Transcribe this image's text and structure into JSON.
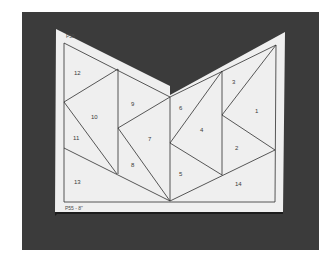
{
  "photo": {
    "subject": "paper piecing quilt pattern on dark background",
    "background_color": "#3b3b3b",
    "paper_color": "#efefef",
    "line_color": "#2e2e2e"
  },
  "pattern": {
    "top_label": "P55",
    "bottom_label": "P55 - 8\"",
    "pieces": [
      {
        "id": "1",
        "label": "1",
        "x": 255,
        "y": 111
      },
      {
        "id": "2",
        "label": "2",
        "x": 236,
        "y": 148
      },
      {
        "id": "3",
        "label": "3",
        "x": 233,
        "y": 82
      },
      {
        "id": "4",
        "label": "4",
        "x": 202,
        "y": 130
      },
      {
        "id": "5",
        "label": "5",
        "x": 180,
        "y": 174
      },
      {
        "id": "6",
        "label": "6",
        "x": 180,
        "y": 108
      },
      {
        "id": "7",
        "label": "7",
        "x": 150,
        "y": 139
      },
      {
        "id": "8",
        "label": "8",
        "x": 132,
        "y": 165
      },
      {
        "id": "9",
        "label": "9",
        "x": 133,
        "y": 104
      },
      {
        "id": "10",
        "label": "10",
        "x": 94,
        "y": 117
      },
      {
        "id": "11",
        "label": "11",
        "x": 76,
        "y": 138
      },
      {
        "id": "12",
        "label": "12",
        "x": 76,
        "y": 73
      },
      {
        "id": "13",
        "label": "13",
        "x": 76,
        "y": 182
      },
      {
        "id": "14",
        "label": "14",
        "x": 238,
        "y": 184
      }
    ]
  }
}
